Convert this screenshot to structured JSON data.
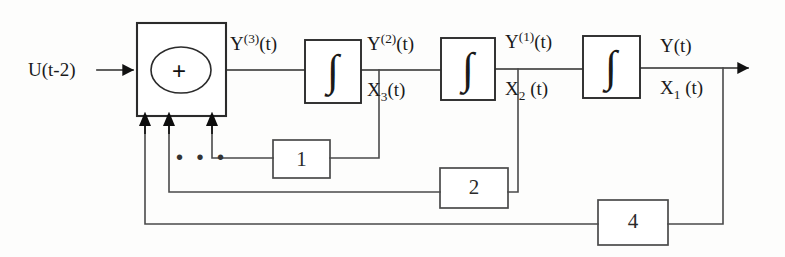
{
  "diagram": {
    "type": "control-block-diagram",
    "stroke_color": "#2b2b2b",
    "fill_color": "#ffffff",
    "text_color": "#1a1a1a",
    "canvas": {
      "width": 785,
      "height": 257
    }
  },
  "input": {
    "label": "U(t-2)",
    "arrow": "input-arrow"
  },
  "summer": {
    "symbol": "+",
    "name": "summing-junction"
  },
  "integrators": [
    {
      "id": "integrator-1",
      "symbol": "∫"
    },
    {
      "id": "integrator-2",
      "symbol": "∫"
    },
    {
      "id": "integrator-3",
      "symbol": "∫"
    }
  ],
  "signals": {
    "y3": {
      "base": "Y",
      "sup": "(3)",
      "arg": "(t)"
    },
    "y2": {
      "base": "Y",
      "sup": "(2)",
      "arg": "(t)"
    },
    "y1": {
      "base": "Y",
      "sup": "(1)",
      "arg": "(t)"
    },
    "y": {
      "base": "Y",
      "sup": "",
      "arg": "(t)"
    },
    "x3": {
      "base": "X",
      "sub": "3",
      "arg": "(t)"
    },
    "x2": {
      "base": "X",
      "sub": "2",
      "arg": " (t)"
    },
    "x1": {
      "base": "X",
      "sub": "1",
      "arg": " (t)"
    }
  },
  "feedback_gains": [
    {
      "id": "gain-block-1",
      "label": "1",
      "from": "x3",
      "line_y": 158
    },
    {
      "id": "gain-block-2",
      "label": "2",
      "from": "x2",
      "line_y": 192
    },
    {
      "id": "gain-block-4",
      "label": "4",
      "from": "x1",
      "line_y": 224
    }
  ],
  "ellipsis": {
    "label": "• • •",
    "meaning": "additional-feedback-paths-omitted"
  },
  "output": {
    "label": "Y(t)",
    "arrow": "output-arrow"
  }
}
